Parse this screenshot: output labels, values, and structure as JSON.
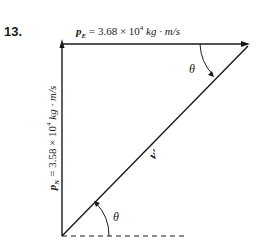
{
  "problem": {
    "number": "13."
  },
  "labels": {
    "top_symbol": "p",
    "top_subscript": "E",
    "top_value": " = 3.68 × 10",
    "top_exp": "4",
    "top_unit": " kg · m/s",
    "side_symbol": "p",
    "side_subscript": "N",
    "side_value": " = 3.58 × 10",
    "side_exp": "4",
    "side_unit": " kg · m/s",
    "diagonal": "v′",
    "angle_top": "θ",
    "angle_bottom": "θ"
  },
  "colors": {
    "line": "#1a1a1a",
    "background": "#ffffff"
  }
}
